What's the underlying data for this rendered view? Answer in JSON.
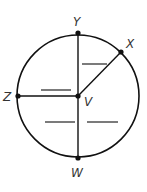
{
  "diagram": {
    "type": "circle-with-radii",
    "center": {
      "label": "V",
      "x": 78,
      "y": 96
    },
    "radius": 61,
    "points": [
      {
        "label": "Y",
        "x": 78,
        "y": 33
      },
      {
        "label": "X",
        "x": 121,
        "y": 52
      },
      {
        "label": "Z",
        "x": 18,
        "y": 96
      },
      {
        "label": "V",
        "x": 78,
        "y": 96
      },
      {
        "label": "W",
        "x": 78,
        "y": 158
      }
    ],
    "segments": [
      "YW",
      "ZV",
      "VX"
    ],
    "blanks": [
      {
        "x1": 82,
        "y1": 64,
        "x2": 107,
        "y2": 64
      },
      {
        "x1": 41,
        "y1": 90,
        "x2": 71,
        "y2": 90
      },
      {
        "x1": 45,
        "y1": 122,
        "x2": 75,
        "y2": 122
      },
      {
        "x1": 87,
        "y1": 122,
        "x2": 118,
        "y2": 122
      }
    ],
    "labels": {
      "Y": "Y",
      "X": "X",
      "Z": "Z",
      "V": "V",
      "W": "W"
    },
    "colors": {
      "stroke": "#111111",
      "label": "#333333"
    }
  }
}
